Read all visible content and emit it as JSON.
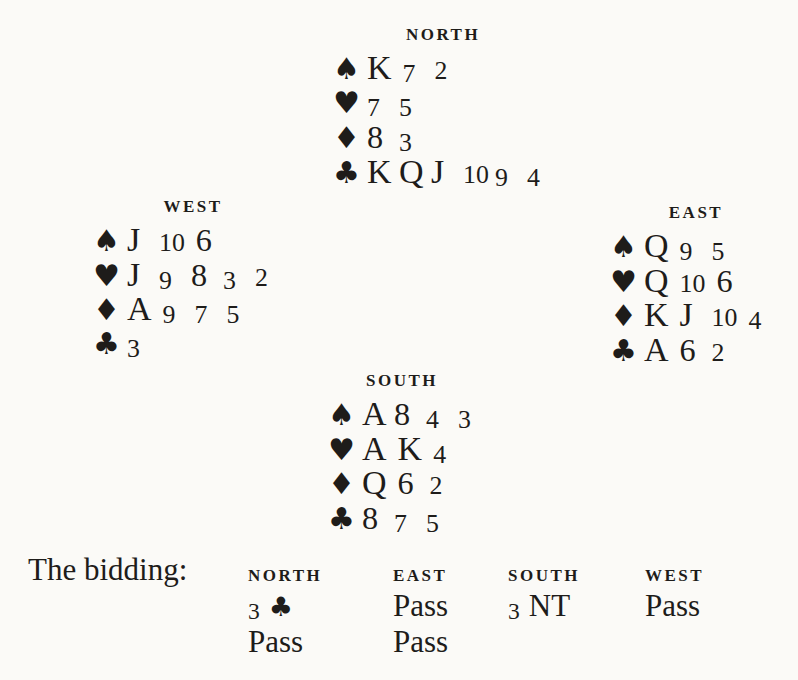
{
  "page": {
    "background": "#fbfaf7",
    "ink": "#1e1c1a"
  },
  "deal": {
    "north": {
      "label": "NORTH",
      "suits": [
        {
          "name": "spades",
          "icon": "spade-icon",
          "symbol": "♠",
          "cards": [
            "K",
            "7",
            "2"
          ]
        },
        {
          "name": "hearts",
          "icon": "heart-icon",
          "symbol": "♥",
          "cards": [
            "7",
            "5"
          ]
        },
        {
          "name": "diamonds",
          "icon": "diamond-icon",
          "symbol": "♦",
          "cards": [
            "8",
            "3"
          ]
        },
        {
          "name": "clubs",
          "icon": "club-icon",
          "symbol": "♣",
          "cards": [
            "K",
            "Q",
            "J",
            "10",
            "9",
            "4"
          ]
        }
      ]
    },
    "west": {
      "label": "WEST",
      "suits": [
        {
          "name": "spades",
          "icon": "spade-icon",
          "symbol": "♠",
          "cards": [
            "J",
            "10",
            "6"
          ]
        },
        {
          "name": "hearts",
          "icon": "heart-icon",
          "symbol": "♥",
          "cards": [
            "J",
            "9",
            "8",
            "3",
            "2"
          ]
        },
        {
          "name": "diamonds",
          "icon": "diamond-icon",
          "symbol": "♦",
          "cards": [
            "A",
            "9",
            "7",
            "5"
          ]
        },
        {
          "name": "clubs",
          "icon": "club-icon",
          "symbol": "♣",
          "cards": [
            "3"
          ]
        }
      ]
    },
    "east": {
      "label": "EAST",
      "suits": [
        {
          "name": "spades",
          "icon": "spade-icon",
          "symbol": "♠",
          "cards": [
            "Q",
            "9",
            "5"
          ]
        },
        {
          "name": "hearts",
          "icon": "heart-icon",
          "symbol": "♥",
          "cards": [
            "Q",
            "10",
            "6"
          ]
        },
        {
          "name": "diamonds",
          "icon": "diamond-icon",
          "symbol": "♦",
          "cards": [
            "K",
            "J",
            "10",
            "4"
          ]
        },
        {
          "name": "clubs",
          "icon": "club-icon",
          "symbol": "♣",
          "cards": [
            "A",
            "6",
            "2"
          ]
        }
      ]
    },
    "south": {
      "label": "SOUTH",
      "suits": [
        {
          "name": "spades",
          "icon": "spade-icon",
          "symbol": "♠",
          "cards": [
            "A",
            "8",
            "4",
            "3"
          ]
        },
        {
          "name": "hearts",
          "icon": "heart-icon",
          "symbol": "♥",
          "cards": [
            "A",
            "K",
            "4"
          ]
        },
        {
          "name": "diamonds",
          "icon": "diamond-icon",
          "symbol": "♦",
          "cards": [
            "Q",
            "6",
            "2"
          ]
        },
        {
          "name": "clubs",
          "icon": "club-icon",
          "symbol": "♣",
          "cards": [
            "8",
            "7",
            "5"
          ]
        }
      ]
    }
  },
  "bidding": {
    "caption": "The bidding:",
    "columns": [
      {
        "header": "NORTH",
        "bids": [
          "3 ♣",
          "Pass"
        ]
      },
      {
        "header": "EAST",
        "bids": [
          "Pass",
          "Pass"
        ]
      },
      {
        "header": "SOUTH",
        "bids": [
          "3 NT"
        ]
      },
      {
        "header": "WEST",
        "bids": [
          "Pass"
        ]
      }
    ]
  }
}
